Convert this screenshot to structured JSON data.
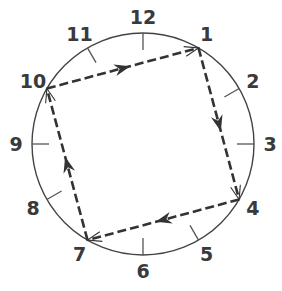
{
  "diagram": {
    "type": "clock-face-with-square-path",
    "center": [
      143,
      144
    ],
    "radius": 111,
    "colors": {
      "circle": "#444444",
      "ticks": "#555555",
      "path": "#333333",
      "numbers": "#3a3a3a"
    },
    "numbers": [
      {
        "label": "12",
        "hour": 12
      },
      {
        "label": "1",
        "hour": 1
      },
      {
        "label": "2",
        "hour": 2
      },
      {
        "label": "3",
        "hour": 3
      },
      {
        "label": "4",
        "hour": 4
      },
      {
        "label": "5",
        "hour": 5
      },
      {
        "label": "6",
        "hour": 6
      },
      {
        "label": "7",
        "hour": 7
      },
      {
        "label": "8",
        "hour": 8
      },
      {
        "label": "9",
        "hour": 9
      },
      {
        "label": "10",
        "hour": 10
      },
      {
        "label": "11",
        "hour": 11
      }
    ],
    "path": {
      "vertices": [
        "10",
        "1",
        "4",
        "7"
      ],
      "edges": [
        {
          "from": "10",
          "to": "1"
        },
        {
          "from": "1",
          "to": "4"
        },
        {
          "from": "4",
          "to": "7"
        },
        {
          "from": "7",
          "to": "10"
        }
      ],
      "style": "dashed",
      "direction": "clockwise"
    }
  }
}
